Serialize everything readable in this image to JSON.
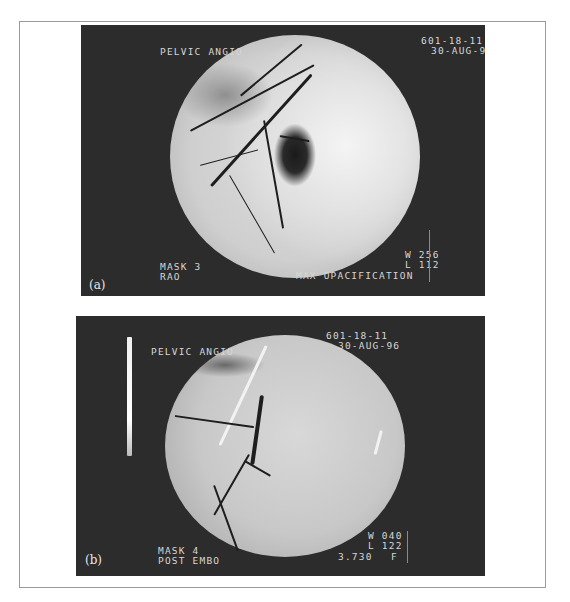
{
  "figure": {
    "panels": [
      {
        "label": "(a)",
        "header_left": "PELVIC ANGIO",
        "header_right_line1": "601-18-11",
        "header_right_line2": "30-AUG-96",
        "footer_left_line1": "MASK 3",
        "footer_left_line2": "RAO",
        "footer_right_line1": "W 256",
        "footer_right_line2": "L 112",
        "footer_right_line3": "MAX OPACIFICATION",
        "image": "pelvic-angiogram-max-opacification"
      },
      {
        "label": "(b)",
        "header_left": "PELVIC ANGIO",
        "header_right_line1": "601-18-11",
        "header_right_line2": "30-AUG-96",
        "footer_left_line1": "MASK 4",
        "footer_left_line2": "POST EMBO",
        "footer_right_line1": "W 040",
        "footer_right_line2": "L 122",
        "footer_right_line3": "3.730",
        "footer_right_flag": "F",
        "image": "pelvic-angiogram-post-embolization"
      }
    ]
  },
  "colors": {
    "panel_background": "#2c2c2c",
    "overlay_text": "#d6d6d6",
    "frame_border": "#9a9a9a"
  }
}
